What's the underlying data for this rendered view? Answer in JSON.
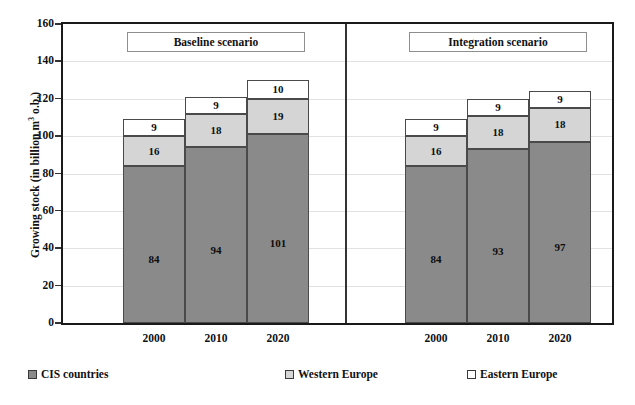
{
  "chart_data": {
    "type": "bar",
    "subtype": "stacked-bar-grouped-panels",
    "title": "",
    "xlabel": "",
    "ylabel": "Growing stock (in billion m",
    "ylabel_sup": "3",
    "ylabel_tail": " o.b.)",
    "ylim": [
      0,
      160
    ],
    "ytick_step": 20,
    "yticks": [
      "0",
      "20",
      "40",
      "60",
      "80",
      "100",
      "120",
      "140",
      "160"
    ],
    "grid": true,
    "grid_axis": "y",
    "legend_position": "bottom",
    "categories": [
      "2000",
      "2010",
      "2020"
    ],
    "panels": [
      {
        "name": "baseline",
        "label": "Baseline scenario",
        "bars": [
          {
            "category": "2000",
            "segments": [
              {
                "series": "CIS countries",
                "value": 84,
                "label": "84"
              },
              {
                "series": "Western Europe",
                "value": 16,
                "label": "16"
              },
              {
                "series": "Eastern Europe",
                "value": 9,
                "label": "9"
              }
            ],
            "total": 109
          },
          {
            "category": "2010",
            "segments": [
              {
                "series": "CIS countries",
                "value": 94,
                "label": "94"
              },
              {
                "series": "Western Europe",
                "value": 18,
                "label": "18"
              },
              {
                "series": "Eastern Europe",
                "value": 9,
                "label": "9"
              }
            ],
            "total": 121
          },
          {
            "category": "2020",
            "segments": [
              {
                "series": "CIS countries",
                "value": 101,
                "label": "101"
              },
              {
                "series": "Western Europe",
                "value": 19,
                "label": "19"
              },
              {
                "series": "Eastern Europe",
                "value": 10,
                "label": "10"
              }
            ],
            "total": 130
          }
        ]
      },
      {
        "name": "integration",
        "label": "Integration scenario",
        "bars": [
          {
            "category": "2000",
            "segments": [
              {
                "series": "CIS countries",
                "value": 84,
                "label": "84"
              },
              {
                "series": "Western Europe",
                "value": 16,
                "label": "16"
              },
              {
                "series": "Eastern Europe",
                "value": 9,
                "label": "9"
              }
            ],
            "total": 109
          },
          {
            "category": "2010",
            "segments": [
              {
                "series": "CIS countries",
                "value": 93,
                "label": "93"
              },
              {
                "series": "Western Europe",
                "value": 18,
                "label": "18"
              },
              {
                "series": "Eastern Europe",
                "value": 9,
                "label": "9"
              }
            ],
            "total": 120
          },
          {
            "category": "2020",
            "segments": [
              {
                "series": "CIS countries",
                "value": 97,
                "label": "97"
              },
              {
                "series": "Western Europe",
                "value": 18,
                "label": "18"
              },
              {
                "series": "Eastern Europe",
                "value": 9,
                "label": "9"
              }
            ],
            "total": 124
          }
        ]
      }
    ],
    "series": [
      {
        "name": "CIS countries",
        "key": "cis",
        "color": "#8a8a8a"
      },
      {
        "name": "Western Europe",
        "key": "west",
        "color": "#d5d5d5"
      },
      {
        "name": "Eastern Europe",
        "key": "east",
        "color": "#ffffff"
      }
    ]
  },
  "legend": {
    "items": [
      {
        "label": "CIS countries",
        "swatch": "cis"
      },
      {
        "label": "Western Europe",
        "swatch": "west"
      },
      {
        "label": "Eastern Europe",
        "swatch": "east"
      }
    ]
  },
  "colors": {
    "cis": "#8a8a8a",
    "west": "#d5d5d5",
    "east": "#ffffff",
    "axis": "#1a1a1a",
    "grid": "#e2e2e2",
    "text": "#111111"
  }
}
